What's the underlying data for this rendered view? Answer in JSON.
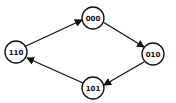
{
  "diagram": {
    "type": "state-transition-cycle",
    "nodes": [
      {
        "id": "000",
        "label": "000",
        "cx": 93,
        "cy": 18
      },
      {
        "id": "010",
        "label": "010",
        "cx": 153,
        "cy": 54
      },
      {
        "id": "101",
        "label": "101",
        "cx": 93,
        "cy": 88
      },
      {
        "id": "110",
        "label": "110",
        "cx": 16,
        "cy": 52
      }
    ],
    "edges": [
      {
        "from": "110",
        "to": "000"
      },
      {
        "from": "000",
        "to": "010"
      },
      {
        "from": "010",
        "to": "101"
      },
      {
        "from": "101",
        "to": "110"
      }
    ],
    "colors": {
      "stroke": "#111111",
      "fill": "#ffffff"
    }
  }
}
